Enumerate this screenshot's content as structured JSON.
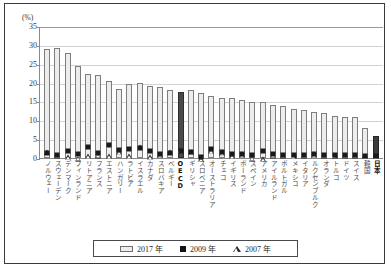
{
  "axis": {
    "unit_label": "(%)",
    "yticks": [
      0,
      5,
      10,
      15,
      20,
      25,
      30,
      35
    ]
  },
  "legend": {
    "items": [
      {
        "label": "2017 年",
        "marker": "bar"
      },
      {
        "label": "2009 年",
        "marker": "square"
      },
      {
        "label": "2007 年",
        "marker": "triangle"
      }
    ]
  },
  "chart_data": {
    "type": "bar",
    "title": "",
    "xlabel": "",
    "ylabel": "(%)",
    "ylim": [
      0,
      35
    ],
    "grid": true,
    "legend_position": "bottom",
    "categories": [
      "ノルウェー",
      "スウェーデン",
      "デンマーク",
      "フィンランド",
      "リトアニア",
      "フランス",
      "エストニア",
      "ハンガリー",
      "ラトビア",
      "イスラエル",
      "カナダ",
      "スロバキア",
      "ベルギー",
      "OECD",
      "ギリシャ",
      "スロベニア",
      "オーストラリア",
      "チェコ",
      "イギリス",
      "ポーランド",
      "スペイン",
      "アメリカ",
      "アイルランド",
      "ポルトガル",
      "メキシコ",
      "イタリア",
      "ルクセンブルク",
      "オランダ",
      "トルコ",
      "ドイツ",
      "スイス",
      "韓国",
      "日本"
    ],
    "highlight_categories": [
      "OECD",
      "日本"
    ],
    "series": [
      {
        "name": "2017 年",
        "marker": "bar",
        "values": [
          29.0,
          29.3,
          27.9,
          24.3,
          22.2,
          22.0,
          20.5,
          18.4,
          19.6,
          19.8,
          19.0,
          18.8,
          18.0,
          17.5,
          18.0,
          17.3,
          16.5,
          16.0,
          16.0,
          15.3,
          14.8,
          14.8,
          14.0,
          13.7,
          13.0,
          12.8,
          12.3,
          12.0,
          11.2,
          10.9,
          10.8,
          8.0,
          5.8
        ]
      },
      {
        "name": "2009 年",
        "marker": "square",
        "values": [
          30.0,
          29.8,
          29.6,
          25.2,
          24.9,
          23.0,
          23.8,
          20.2,
          21.6,
          22.2,
          20.5,
          19.6,
          19.0,
          19.0,
          19.4,
          17.4,
          18.5,
          17.3,
          16.7,
          16.0,
          15.3,
          16.3,
          14.8,
          14.3,
          13.5,
          13.4,
          13.0,
          12.6,
          11.8,
          11.4,
          11.3,
          8.3,
          6.1
        ]
      },
      {
        "name": "2007 年",
        "marker": "triangle",
        "values": [
          30.3,
          29.7,
          27.8,
          23.9,
          22.4,
          22.3,
          20.7,
          19.6,
          19.8,
          22.4,
          19.0,
          19.3,
          19.2,
          19.3,
          19.3,
          16.7,
          18.0,
          17.0,
          16.2,
          15.8,
          14.4,
          14.2,
          14.3,
          14.0,
          13.2,
          13.2,
          12.8,
          12.4,
          11.5,
          11.2,
          11.1,
          8.2,
          6.0
        ]
      }
    ]
  }
}
